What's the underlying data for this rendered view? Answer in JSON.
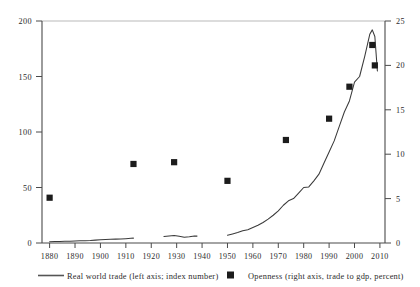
{
  "chart_data": {
    "type": "line",
    "title": "",
    "xlabel": "",
    "ylabel": "",
    "grid": false,
    "legend_position": "bottom",
    "xlim": [
      1877,
      2012
    ],
    "x_ticks": [
      "1880",
      "1890",
      "1900",
      "1910",
      "1920",
      "1930",
      "1940",
      "1950",
      "1960",
      "1970",
      "1980",
      "1990",
      "2000",
      "2010"
    ],
    "left_axis": {
      "label": "Real world trade (left axis; index number)",
      "ylim": [
        0,
        200
      ],
      "ticks": [
        "0",
        "50",
        "100",
        "150",
        "200"
      ]
    },
    "right_axis": {
      "label": "Openness (right axis, trade to gdp, percent)",
      "ylim": [
        0,
        25
      ],
      "ticks": [
        "0",
        "5",
        "10",
        "15",
        "20",
        "25"
      ]
    },
    "series": [
      {
        "name": "Real world trade (left axis; index number)",
        "type": "line",
        "axis": "left",
        "x": [
          1880,
          1882,
          1884,
          1886,
          1888,
          1890,
          1892,
          1894,
          1896,
          1898,
          1900,
          1902,
          1904,
          1906,
          1908,
          1910,
          1912,
          1913,
          1925,
          1927,
          1929,
          1931,
          1933,
          1935,
          1937,
          1938,
          1950,
          1952,
          1954,
          1956,
          1958,
          1960,
          1962,
          1964,
          1966,
          1968,
          1970,
          1972,
          1974,
          1976,
          1978,
          1980,
          1982,
          1984,
          1986,
          1988,
          1990,
          1992,
          1994,
          1996,
          1998,
          2000,
          2002,
          2004,
          2006,
          2007,
          2008,
          2009
        ],
        "values": [
          1.2,
          1.3,
          1.4,
          1.5,
          1.6,
          1.8,
          2.0,
          2.1,
          2.3,
          2.6,
          3.0,
          3.2,
          3.3,
          3.5,
          3.6,
          3.9,
          4.2,
          4.4,
          5.8,
          6.4,
          6.8,
          6.0,
          5.2,
          5.6,
          6.4,
          6.2,
          7.0,
          8.2,
          9.4,
          11.0,
          12.0,
          14.0,
          16.0,
          18.5,
          21.5,
          25.0,
          29.0,
          34.0,
          38.0,
          40.0,
          45.0,
          50.0,
          50.5,
          56.0,
          62.0,
          72.0,
          82.0,
          92.0,
          105.0,
          118.0,
          128.0,
          145.0,
          150.0,
          168.0,
          188.0,
          192.0,
          186.0,
          155.0
        ]
      },
      {
        "name": "Openness (right axis, trade to gdp, percent)",
        "type": "scatter",
        "axis": "right",
        "x": [
          1880,
          1913,
          1929,
          1950,
          1973,
          1990,
          1998,
          2007,
          2008
        ],
        "values": [
          5.1,
          8.9,
          9.1,
          7.0,
          11.6,
          14.0,
          17.6,
          22.3,
          20.0
        ]
      }
    ]
  },
  "legend": {
    "items": [
      {
        "marker": "line-swatch",
        "label": "Real world trade (left axis; index number)"
      },
      {
        "marker": "square-swatch",
        "label": "Openness (right axis, trade to gdp, percent)"
      }
    ]
  }
}
